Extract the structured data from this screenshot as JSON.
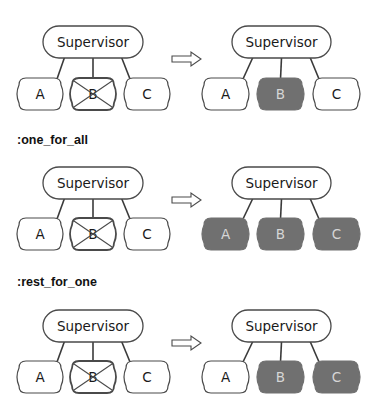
{
  "colors": {
    "stroke": "#4a4a4a",
    "connector": "#3a3a3a",
    "node_fill": "#ffffff",
    "restarted_fill": "#707070",
    "restarted_text": "#d6d6d6",
    "text": "#1a1a1a"
  },
  "sections": [
    {
      "label": null,
      "before": {
        "supervisor": "Supervisor",
        "children": [
          {
            "name": "A",
            "state": "running"
          },
          {
            "name": "B",
            "state": "crashed"
          },
          {
            "name": "C",
            "state": "running"
          }
        ]
      },
      "after": {
        "supervisor": "Supervisor",
        "children": [
          {
            "name": "A",
            "state": "running"
          },
          {
            "name": "B",
            "state": "restarted"
          },
          {
            "name": "C",
            "state": "running"
          }
        ]
      }
    },
    {
      "label": ":one_for_all",
      "before": {
        "supervisor": "Supervisor",
        "children": [
          {
            "name": "A",
            "state": "running"
          },
          {
            "name": "B",
            "state": "crashed"
          },
          {
            "name": "C",
            "state": "running"
          }
        ]
      },
      "after": {
        "supervisor": "Supervisor",
        "children": [
          {
            "name": "A",
            "state": "restarted"
          },
          {
            "name": "B",
            "state": "restarted"
          },
          {
            "name": "C",
            "state": "restarted"
          }
        ]
      }
    },
    {
      "label": ":rest_for_one",
      "before": {
        "supervisor": "Supervisor",
        "children": [
          {
            "name": "A",
            "state": "running"
          },
          {
            "name": "B",
            "state": "crashed"
          },
          {
            "name": "C",
            "state": "running"
          }
        ]
      },
      "after": {
        "supervisor": "Supervisor",
        "children": [
          {
            "name": "A",
            "state": "running"
          },
          {
            "name": "B",
            "state": "restarted"
          },
          {
            "name": "C",
            "state": "restarted"
          }
        ]
      }
    }
  ],
  "labels": {
    "one_for_all": ":one_for_all",
    "rest_for_one": ":rest_for_one"
  }
}
